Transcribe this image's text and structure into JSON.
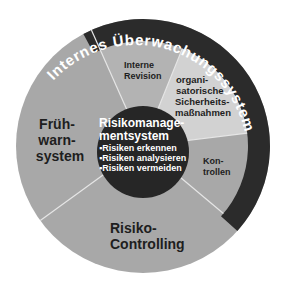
{
  "diagram": {
    "ring_title": "Internes Überwachungssystem",
    "center": {
      "title_line1": "Risikomanage-",
      "title_line2": "mentsystem",
      "bullets": [
        "▪Risiken erkennen",
        "▪Risiken analysieren",
        "▪Risiken vermeiden"
      ]
    },
    "segments": {
      "fruehwarn": {
        "line1": "Früh-",
        "line2": "warn-",
        "line3": "system"
      },
      "revision": {
        "line1": "Interne",
        "line2": "Revision"
      },
      "organisatorisch": {
        "line1": "organi-",
        "line2": "satorische",
        "line3": "Sicherheits-",
        "line4": "maßnahmen"
      },
      "kontrollen": {
        "line1": "Kon-",
        "line2": "trollen"
      },
      "controlling": {
        "line1": "Risiko-",
        "line2": "Controlling"
      }
    },
    "colors": {
      "ring": "#2b2b2b",
      "center": "#262626",
      "segment_medium": "#a8a8a8",
      "segment_revision": "#b3b3b3",
      "segment_light": "#d2d2d2",
      "separator": "#e6e6e6"
    }
  }
}
